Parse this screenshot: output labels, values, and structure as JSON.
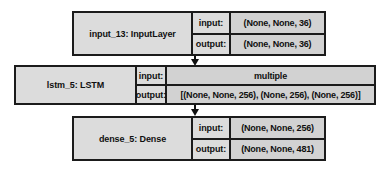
{
  "diagram": {
    "type": "keras-model-graph",
    "background_color": "#ffffff",
    "box_fill_color": "#dcdcdc",
    "value_fill_color": "#d2d2d2",
    "border_color": "#1b1b1b",
    "text_color": "#101010",
    "nodes": [
      {
        "id": "input_13",
        "name": "input_13: InputLayer",
        "input_label": "input:",
        "input_value": "(None, None, 36)",
        "output_label": "output:",
        "output_value": "(None, None, 36)"
      },
      {
        "id": "lstm_5",
        "name": "lstm_5: LSTM",
        "input_label": "input:",
        "input_value": "multiple",
        "output_label": "output:",
        "output_value": "[(None, None, 256), (None, 256), (None, 256)]"
      },
      {
        "id": "dense_5",
        "name": "dense_5: Dense",
        "input_label": "input:",
        "input_value": "(None, None, 256)",
        "output_label": "output:",
        "output_value": "(None, None, 481)"
      }
    ],
    "edges": [
      {
        "from": "input_13",
        "to": "lstm_5",
        "style": "arrow-down"
      },
      {
        "from": "lstm_5",
        "to": "dense_5",
        "style": "arrow-down"
      }
    ]
  }
}
